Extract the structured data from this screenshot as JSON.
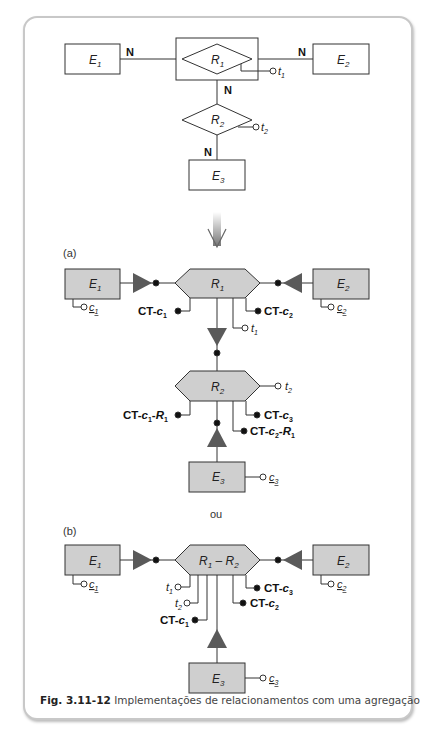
{
  "figure": {
    "caption_label": "Fig. 3.11-12",
    "caption_text": "Implementações de relacionamentos com uma agregação"
  },
  "top_diagram": {
    "entities": [
      "E1",
      "E2",
      "E3"
    ],
    "relationships": [
      "R1",
      "R2"
    ],
    "attributes": [
      "t1",
      "t2"
    ],
    "cardinalities": [
      "N",
      "N",
      "N",
      "N"
    ]
  },
  "arrow": "down-arrow",
  "option_a": {
    "label": "(a)",
    "entities": [
      {
        "name": "E1",
        "attr": "c1"
      },
      {
        "name": "E2",
        "attr": "c2"
      },
      {
        "name": "E3",
        "attr": "c3"
      }
    ],
    "relationships": [
      {
        "name": "R1",
        "keys": [
          "CT-c1",
          "CT-c2"
        ],
        "attrs": [
          "t1"
        ]
      },
      {
        "name": "R2",
        "keys": [
          "CT-c1-R1",
          "CT-c3",
          "CT-c2-R1"
        ],
        "attrs": [
          "t2"
        ]
      }
    ]
  },
  "separator": "ou",
  "option_b": {
    "label": "(b)",
    "entities": [
      {
        "name": "E1",
        "attr": "c1"
      },
      {
        "name": "E2",
        "attr": "c2"
      },
      {
        "name": "E3",
        "attr": "c3"
      }
    ],
    "relationships": [
      {
        "name": "R1 – R2",
        "keys": [
          "CT-c3",
          "CT-c2",
          "CT-c1"
        ],
        "attrs": [
          "t1",
          "t2"
        ]
      }
    ]
  },
  "colors": {
    "fill": "#cfcfcf",
    "triangle": "#5a5a5a",
    "line": "#333333"
  }
}
